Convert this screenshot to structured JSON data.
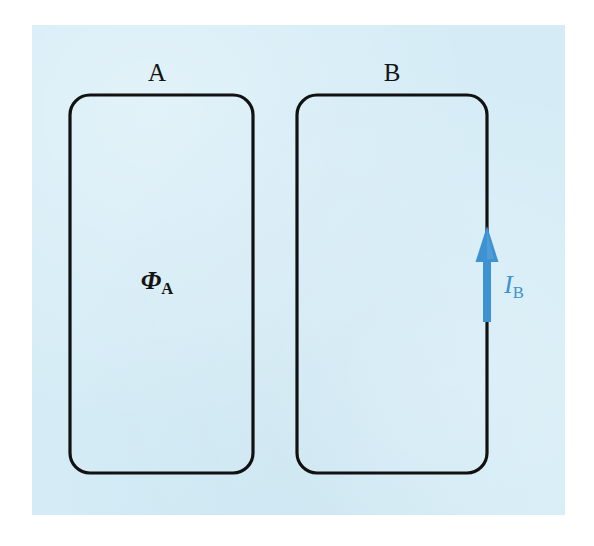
{
  "figure": {
    "type": "physics-diagram",
    "canvas": {
      "width": 594,
      "height": 546,
      "background_color": "#ffffff"
    },
    "panel": {
      "fill_color": "#d5ecf6",
      "x": 32,
      "y": 25,
      "width": 533,
      "height": 490
    },
    "loops": [
      {
        "id": "loop-a",
        "label": "A",
        "label_x": 157,
        "label_y": 60,
        "x": 70,
        "y": 95,
        "width": 183,
        "height": 378,
        "corner_radius": 20,
        "stroke_color": "#111111",
        "stroke_width": 3.2
      },
      {
        "id": "loop-b",
        "label": "B",
        "label_x": 392,
        "label_y": 60,
        "x": 297,
        "y": 95,
        "width": 190,
        "height": 378,
        "corner_radius": 20,
        "stroke_color": "#111111",
        "stroke_width": 3.2
      }
    ],
    "flux_label": {
      "symbol": "Φ",
      "subscript": "A",
      "color": "#131313",
      "x": 157,
      "y": 283
    },
    "current_arrow": {
      "color": "#3f92d2",
      "direction": "up",
      "x": 487,
      "tail_y": 322,
      "head_y": 228,
      "shaft_width": 8,
      "head_width": 23,
      "head_length": 34
    },
    "current_label": {
      "symbol": "I",
      "subscript": "B",
      "color": "#3f92d2",
      "x": 513,
      "y": 287
    }
  }
}
